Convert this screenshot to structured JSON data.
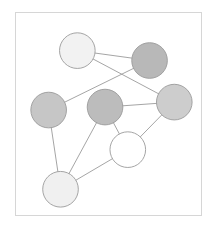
{
  "figure": {
    "kind": "node-link-graph",
    "background_color": "#ffffff",
    "frame": {
      "border_color": "#d6d6d6",
      "fill_color": "#ffffff",
      "x": 15,
      "y": 12,
      "width": 187,
      "height": 204
    }
  },
  "chart_data": {
    "type": "scatter",
    "title": "",
    "subtitle": "",
    "xlabel": "",
    "ylabel": "",
    "grid": false,
    "legend_position": "none",
    "xlim": [
      0,
      187
    ],
    "ylim": [
      0,
      204
    ],
    "graph": {
      "node_count": 7,
      "edge_count": 9,
      "node_radius": 18,
      "node_stroke_color": "#9a9a9a",
      "edge_stroke_color": "#9a9a9a",
      "nodes": [
        {
          "id": "n1",
          "label": "",
          "x": 62,
          "y": 38,
          "r": 18,
          "fill": "#f2f2f2"
        },
        {
          "id": "n2",
          "label": "",
          "x": 135,
          "y": 48,
          "r": 18,
          "fill": "#b8b8b8"
        },
        {
          "id": "n3",
          "label": "",
          "x": 160,
          "y": 90,
          "r": 18,
          "fill": "#cdcdcd"
        },
        {
          "id": "n4",
          "label": "",
          "x": 33,
          "y": 98,
          "r": 18,
          "fill": "#c6c6c6"
        },
        {
          "id": "n5",
          "label": "",
          "x": 90,
          "y": 95,
          "r": 18,
          "fill": "#bcbcbc"
        },
        {
          "id": "n6",
          "label": "",
          "x": 113,
          "y": 138,
          "r": 18,
          "fill": "#ffffff"
        },
        {
          "id": "n7",
          "label": "",
          "x": 45,
          "y": 178,
          "r": 18,
          "fill": "#f0f0f0"
        }
      ],
      "edges": [
        {
          "source": "n1",
          "target": "n2"
        },
        {
          "source": "n1",
          "target": "n3"
        },
        {
          "source": "n2",
          "target": "n4"
        },
        {
          "source": "n4",
          "target": "n7"
        },
        {
          "source": "n5",
          "target": "n3"
        },
        {
          "source": "n5",
          "target": "n6"
        },
        {
          "source": "n5",
          "target": "n7"
        },
        {
          "source": "n6",
          "target": "n3"
        },
        {
          "source": "n6",
          "target": "n7"
        }
      ]
    }
  }
}
